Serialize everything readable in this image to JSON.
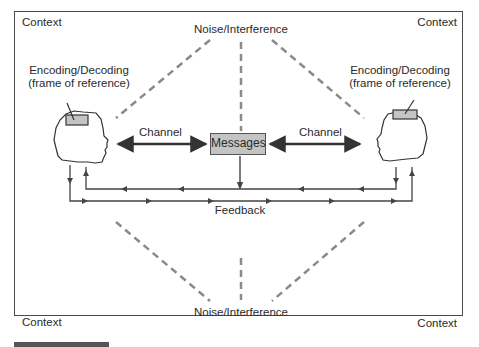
{
  "diagram": {
    "corners": {
      "top_left": "Context",
      "top_right": "Context",
      "bottom_left": "Context",
      "bottom_right": "Context"
    },
    "noise_top": "Noise/Interference",
    "noise_bottom": "Noise/Interference",
    "left_person": {
      "label_line1": "Encoding/Decoding",
      "label_line2": "(frame of reference)",
      "icon": "head-profile-icon"
    },
    "right_person": {
      "label_line1": "Encoding/Decoding",
      "label_line2": "(frame of reference)",
      "icon": "head-profile-icon"
    },
    "channel_left": "Channel",
    "channel_right": "Channel",
    "messages": "Messages",
    "feedback": "Feedback",
    "colors": {
      "line": "#4a4a4a",
      "dashed": "#8a8a8a",
      "box_fill": "#c4c4c4",
      "frame": "#4a4a4a"
    }
  }
}
